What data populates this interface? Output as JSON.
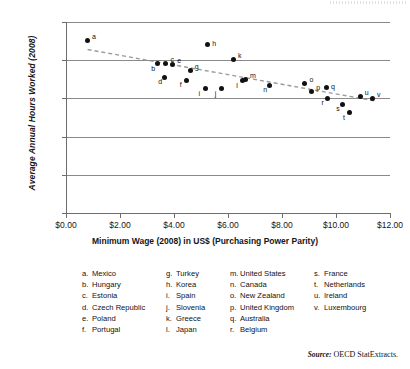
{
  "chart_data": {
    "type": "scatter",
    "title": "",
    "xlabel": "Minimum Wage (2008) in US$ (Purchasing Power Parity)",
    "ylabel": "Average Annual Hours Worked (2008)",
    "xlim": [
      0,
      12
    ],
    "ylim": [
      0,
      2500
    ],
    "xticks": [
      "$0.00",
      "$2.00",
      "$4.00",
      "$6.00",
      "$8.00",
      "$10.00",
      "$12.00"
    ],
    "xtick_values": [
      0,
      2,
      4,
      6,
      8,
      10,
      12
    ],
    "yticks": [
      "0",
      "500",
      "1000",
      "1500",
      "2000",
      "2500"
    ],
    "ytick_values": [
      0,
      500,
      1000,
      1500,
      2000,
      2500
    ],
    "grid": "horizontal",
    "legend_position": "below-plot",
    "trendline": {
      "style": "dashed",
      "color": "#9a9a9a",
      "x_start": 0.8,
      "y_start": 2140,
      "x_end": 11.4,
      "y_end": 1470
    },
    "points": [
      {
        "key": "a",
        "label": "Mexico",
        "x": 0.8,
        "y": 2255,
        "label_pos": "right-up"
      },
      {
        "key": "b",
        "label": "Hungary",
        "x": 3.4,
        "y": 1955,
        "label_pos": "left-down"
      },
      {
        "key": "c",
        "label": "Estonia",
        "x": 3.7,
        "y": 1960,
        "label_pos": "right-up"
      },
      {
        "key": "d",
        "label": "Czech Republic",
        "x": 3.66,
        "y": 1775,
        "label_pos": "left-down"
      },
      {
        "key": "e",
        "label": "Poland",
        "x": 3.95,
        "y": 1945,
        "label_pos": "right-up"
      },
      {
        "key": "f",
        "label": "Portugal",
        "x": 4.45,
        "y": 1740,
        "label_pos": "left-down"
      },
      {
        "key": "g",
        "label": "Turkey",
        "x": 4.6,
        "y": 1870,
        "label_pos": "right-up"
      },
      {
        "key": "h",
        "label": "Korea",
        "x": 5.25,
        "y": 2210,
        "label_pos": "right"
      },
      {
        "key": "i",
        "label": "Spain",
        "x": 5.15,
        "y": 1625,
        "label_pos": "left-down"
      },
      {
        "key": "j",
        "label": "Slovenia",
        "x": 5.75,
        "y": 1625,
        "label_pos": "left-down"
      },
      {
        "key": "k",
        "label": "Greece",
        "x": 6.2,
        "y": 2010,
        "label_pos": "right-up"
      },
      {
        "key": "l",
        "label": "Japan",
        "x": 6.55,
        "y": 1730,
        "label_pos": "left-down"
      },
      {
        "key": "m",
        "label": "United States",
        "x": 6.65,
        "y": 1745,
        "label_pos": "right-up"
      },
      {
        "key": "n",
        "label": "Canada",
        "x": 7.55,
        "y": 1675,
        "label_pos": "left-down"
      },
      {
        "key": "o",
        "label": "New Zealand",
        "x": 8.85,
        "y": 1700,
        "label_pos": "right-up"
      },
      {
        "key": "p",
        "label": "United Kingdom",
        "x": 9.1,
        "y": 1590,
        "label_pos": "right-up"
      },
      {
        "key": "q",
        "label": "Australia",
        "x": 9.65,
        "y": 1645,
        "label_pos": "right"
      },
      {
        "key": "r",
        "label": "Belgium",
        "x": 9.7,
        "y": 1500,
        "label_pos": "left-down"
      },
      {
        "key": "s",
        "label": "France",
        "x": 10.25,
        "y": 1425,
        "label_pos": "left-down"
      },
      {
        "key": "t",
        "label": "Netherlands",
        "x": 10.5,
        "y": 1310,
        "label_pos": "left-down"
      },
      {
        "key": "u",
        "label": "Ireland",
        "x": 10.9,
        "y": 1525,
        "label_pos": "right-up"
      },
      {
        "key": "v",
        "label": "Luxembourg",
        "x": 11.35,
        "y": 1495,
        "label_pos": "right-up"
      }
    ]
  },
  "axes": {
    "ylabel": "Average Annual Hours Worked (2008)",
    "xlabel": "Minimum Wage (2008) in US$ (Purchasing Power Parity)"
  },
  "legend": {
    "columns": [
      [
        {
          "key": "a.",
          "label": "Mexico"
        },
        {
          "key": "b.",
          "label": "Hungary"
        },
        {
          "key": "c.",
          "label": "Estonia"
        },
        {
          "key": "d.",
          "label": "Czech Republic"
        },
        {
          "key": "e.",
          "label": "Poland"
        },
        {
          "key": "f.",
          "label": "Portugal"
        }
      ],
      [
        {
          "key": "g.",
          "label": "Turkey"
        },
        {
          "key": "h.",
          "label": "Korea"
        },
        {
          "key": "i.",
          "label": "Spain"
        },
        {
          "key": "j.",
          "label": "Slovenia"
        },
        {
          "key": "k.",
          "label": "Greece"
        },
        {
          "key": "l.",
          "label": "Japan"
        }
      ],
      [
        {
          "key": "m.",
          "label": "United States"
        },
        {
          "key": "n.",
          "label": "Canada"
        },
        {
          "key": "o.",
          "label": "New Zealand"
        },
        {
          "key": "p.",
          "label": "United Kingdom"
        },
        {
          "key": "q.",
          "label": "Australia"
        },
        {
          "key": "r.",
          "label": "Belgium"
        }
      ],
      [
        {
          "key": "s.",
          "label": "France"
        },
        {
          "key": "t.",
          "label": "Netherlands"
        },
        {
          "key": "u.",
          "label": "Ireland"
        },
        {
          "key": "v.",
          "label": "Luxembourg"
        }
      ]
    ]
  },
  "source": {
    "prefix": "Source:",
    "text": "OECD StatExtracts."
  }
}
